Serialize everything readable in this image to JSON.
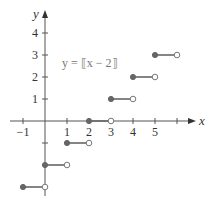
{
  "chart_data": {
    "type": "line",
    "title": "",
    "equation_label": "y = ⟦x − 2⟧",
    "xlabel": "x",
    "ylabel": "y",
    "xlim": [
      -1,
      6.5
    ],
    "ylim": [
      -3.3,
      5
    ],
    "x_ticks": [
      -1,
      1,
      2,
      3,
      4,
      5,
      6
    ],
    "x_tick_labels": [
      "−1",
      "1",
      "2",
      "3",
      "4",
      "5",
      ""
    ],
    "y_ticks": [
      1,
      2,
      3,
      4,
      -1,
      -2
    ],
    "y_tick_labels": [
      "1",
      "2",
      "3",
      "4",
      "",
      ""
    ],
    "grid": false,
    "series": [
      {
        "name": "y = [[x - 2]]",
        "steps": [
          {
            "x_start": -1,
            "x_end": 0,
            "y": -3,
            "closed_left": true,
            "open_right": true
          },
          {
            "x_start": 0,
            "x_end": 1,
            "y": -2,
            "closed_left": true,
            "open_right": true
          },
          {
            "x_start": 1,
            "x_end": 2,
            "y": -1,
            "closed_left": true,
            "open_right": true
          },
          {
            "x_start": 2,
            "x_end": 3,
            "y": 0,
            "closed_left": true,
            "open_right": true
          },
          {
            "x_start": 3,
            "x_end": 4,
            "y": 1,
            "closed_left": true,
            "open_right": true
          },
          {
            "x_start": 4,
            "x_end": 5,
            "y": 2,
            "closed_left": true,
            "open_right": true
          },
          {
            "x_start": 5,
            "x_end": 6,
            "y": 3,
            "closed_left": true,
            "open_right": true
          }
        ]
      }
    ]
  },
  "colors": {
    "axis": "#555555",
    "step": "#666666"
  }
}
